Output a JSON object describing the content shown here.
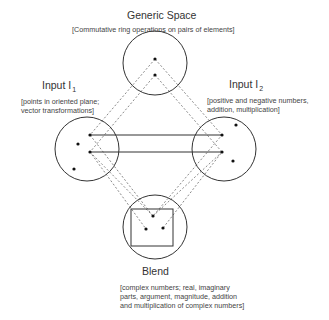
{
  "generic_space": {
    "title": "Generic Space",
    "description": "[Commutative ring operations on pairs of elements]"
  },
  "input1": {
    "title": "Input  I",
    "subscript": "1",
    "description_lines": [
      "[points in oriented plane;",
      "vector transformations]"
    ]
  },
  "input2": {
    "title": "Input  I",
    "subscript": "2",
    "description_lines": [
      "[positive and negative numbers,",
      "addition, multiplication]"
    ]
  },
  "blend": {
    "title": "Blend",
    "description_lines": [
      "[complex numbers; real, imaginary",
      "parts, argument, magnitude, addition",
      "and multiplication of complex numbers]"
    ]
  },
  "colors": {
    "stroke": "#333333",
    "dotted": "#888888",
    "text": "#333333"
  }
}
